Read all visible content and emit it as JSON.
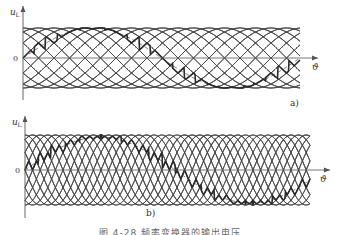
{
  "figure": {
    "caption": "图 4-28  频率变换器的输出电压",
    "panels": [
      {
        "id": "a",
        "label": "a)",
        "y_axis_label": "u",
        "y_axis_sub": "L",
        "x_axis_label": "ϑ",
        "zero_label": "0",
        "axis_x": 23,
        "axis_top": 6,
        "axis_bottom": 100,
        "zero_y": 58,
        "amplitude": 30,
        "x_start": 23,
        "x_end": 300,
        "arrow_end": 318,
        "phase_spacing": 15.5,
        "num_phases": 6,
        "output_period": 277,
        "output_amplitude": 30,
        "label_pos": [
          290,
          106
        ],
        "theta_pos": [
          312,
          70
        ]
      },
      {
        "id": "b",
        "label": "b)",
        "y_axis_label": "u",
        "y_axis_sub": "L",
        "x_axis_label": "ϑ",
        "zero_label": "0",
        "axis_x": 25,
        "axis_top": 116,
        "axis_bottom": 218,
        "zero_y": 170,
        "amplitude": 35,
        "x_start": 25,
        "x_end": 310,
        "arrow_end": 330,
        "phase_spacing": 7.6,
        "num_phases": 6,
        "output_period": 300,
        "output_amplitude": 33,
        "label_pos": [
          146,
          216
        ],
        "theta_pos": [
          320,
          182
        ]
      }
    ]
  },
  "colors": {
    "ink": "#2a2a2a",
    "thin": "#444444",
    "axis": "#555555",
    "dash": "#666666"
  }
}
